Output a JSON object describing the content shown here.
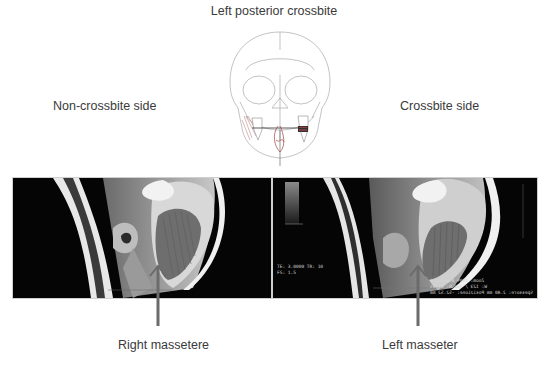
{
  "figure": {
    "title": "Left posterior crossbite",
    "side_labels": {
      "left": "Non-crossbite side",
      "right": "Crossbite side"
    },
    "panels": [
      {
        "id": "mri-left",
        "side": "Non-crossbite side",
        "arrow_label": "Right massetere",
        "overlay_text": []
      },
      {
        "id": "mri-right",
        "side": "Crossbite side",
        "arrow_label": "Left masseter",
        "overlay_text": {
          "top_left_scale": "1.0",
          "bottom_left": [
            "TE: 3.0000 TR: 10",
            "FS: 1.5"
          ],
          "bottom_right": [
            "Zoom: 190% Angolo: 0",
            "W: 123 / 160 R: L: 45",
            "Spessore: 2.40 mm Posizione: -52.52 mm"
          ]
        }
      }
    ],
    "diagram": "frontal skull line drawing with highlighted left posterior teeth and midline marker",
    "colors": {
      "background": "#ffffff",
      "text": "#3a3a3a",
      "arrow": "#6b6b6b",
      "mri_background": "#050505"
    }
  }
}
